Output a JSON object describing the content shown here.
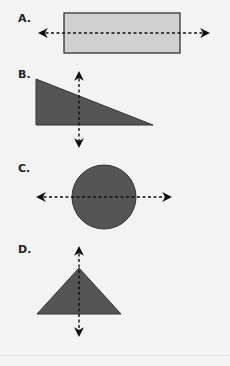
{
  "figure": {
    "type": "line-of-symmetry options",
    "colors": {
      "background": "#f3f3f3",
      "light_fill": "#d0d0d0",
      "dark_fill": "#555555",
      "outline": "#333333",
      "dashed_line": "#111111"
    },
    "options": [
      {
        "label": "A.",
        "shape": "rectangle",
        "fill": "light",
        "line": "horizontal dashed double-arrow through middle"
      },
      {
        "label": "B.",
        "shape": "right triangle",
        "fill": "dark",
        "line": "vertical dashed double-arrow"
      },
      {
        "label": "C.",
        "shape": "circle",
        "fill": "dark",
        "line": "horizontal dashed double-arrow through center"
      },
      {
        "label": "D.",
        "shape": "isosceles triangle",
        "fill": "dark",
        "line": "vertical dashed double-arrow through apex"
      }
    ]
  }
}
